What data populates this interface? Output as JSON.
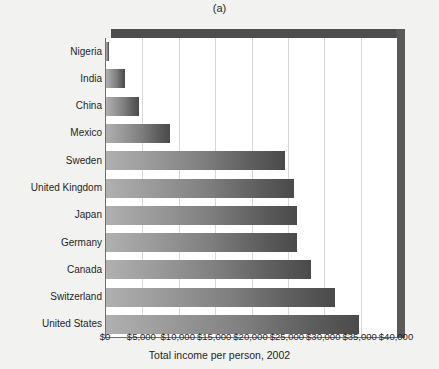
{
  "figure": {
    "title": "(a)",
    "x_axis_title": "Total income per person, 2002"
  },
  "chart_data": {
    "type": "bar",
    "orientation": "horizontal",
    "title": "(a)",
    "xlabel": "Total income per person, 2002",
    "ylabel": "",
    "xlim": [
      0,
      40000
    ],
    "grid": true,
    "legend": false,
    "tick_prefix": "$",
    "categories": [
      "Nigeria",
      "India",
      "China",
      "Mexico",
      "Sweden",
      "United Kingdom",
      "Japan",
      "Germany",
      "Canada",
      "Switzerland",
      "United States"
    ],
    "values": [
      350,
      2600,
      4600,
      8800,
      24600,
      25900,
      26200,
      26300,
      28200,
      31500,
      34800
    ],
    "xticks": [
      0,
      5000,
      10000,
      15000,
      20000,
      25000,
      30000,
      35000,
      40000
    ],
    "xticklabels": [
      "$0",
      "$5,000",
      "$10,000",
      "$15,000",
      "$20,000",
      "$25,000",
      "$30,000",
      "$35,000",
      "$40,000"
    ],
    "bar_gradient": {
      "start": "#b0b0b0",
      "end": "#4a4a4a"
    },
    "frame_color": "#4d4d4d",
    "grid_color": "#d8d8d8",
    "background": "#ffffff",
    "page_background": "#f2f2f0"
  }
}
